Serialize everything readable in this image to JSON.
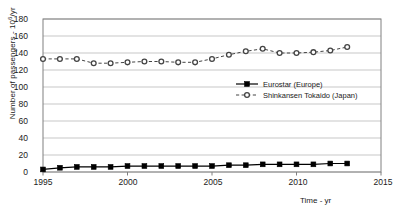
{
  "chart_data": {
    "type": "line",
    "title": "",
    "xlabel": "Time - yr",
    "ylabel": "Number of passengers - 10^6/yr",
    "ylabel_prefix": "Number of passengers - 10",
    "ylabel_exponent": "6",
    "ylabel_suffix": "/yr",
    "xlim": [
      1995,
      2015
    ],
    "ylim": [
      0,
      180
    ],
    "ytick_step": 20,
    "xtick_step": 5,
    "grid": "horizontal",
    "legend_position": "inside-right-middle",
    "yticks": [
      "0",
      "20",
      "40",
      "60",
      "80",
      "100",
      "120",
      "140",
      "160",
      "180"
    ],
    "xticks": [
      "1995",
      "2000",
      "2005",
      "2010",
      "2015"
    ],
    "x": [
      1995,
      1996,
      1997,
      1998,
      1999,
      2000,
      2001,
      2002,
      2003,
      2004,
      2005,
      2006,
      2007,
      2008,
      2009,
      2010,
      2011,
      2012,
      2013
    ],
    "series": [
      {
        "name": "Eurostar (Europe)",
        "marker": "filled-square",
        "line_style": "solid",
        "color": "#000000",
        "values": [
          3,
          5,
          6,
          6,
          6,
          7,
          7,
          7,
          7,
          7,
          7,
          8,
          8,
          9,
          9,
          9,
          9,
          10,
          10
        ]
      },
      {
        "name": "Shinkansen Tokaido (Japan)",
        "marker": "open-circle",
        "line_style": "dashed",
        "color": "#444444",
        "values": [
          133,
          133,
          133,
          128,
          128,
          129,
          130,
          130,
          129,
          129,
          133,
          138,
          142,
          145,
          140,
          140,
          141,
          143,
          147
        ]
      }
    ]
  },
  "legend": {
    "entries": [
      {
        "label": "Eurostar (Europe)"
      },
      {
        "label": "Shinkansen Tokaido (Japan)"
      }
    ]
  },
  "colors": {
    "axis": "#808080",
    "grid": "#b0b0b0",
    "series_1": "#000000",
    "series_2": "#444444",
    "background": "#ffffff"
  }
}
